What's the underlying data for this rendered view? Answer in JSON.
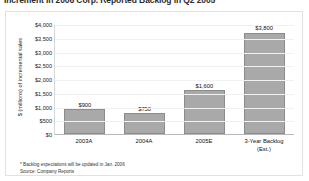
{
  "document": {
    "title": "Increment in 2006 Corp. Reported Backlog in Q2 2005"
  },
  "chart_data": {
    "type": "bar",
    "title": "",
    "categories": [
      "2003A",
      "2004A",
      "2005E",
      "3-Year Backlog (Est.)"
    ],
    "category_lines": [
      [
        "2003A"
      ],
      [
        "2004A"
      ],
      [
        "2005E"
      ],
      [
        "3-Year Backlog",
        "(Est.)"
      ]
    ],
    "values": [
      900,
      750,
      1600,
      3800
    ],
    "value_labels": [
      "$900",
      "$750",
      "$1,600",
      "$3,800"
    ],
    "xlabel": "",
    "ylabel": "$ (millions) of incremental sales",
    "ylim": [
      0,
      4000
    ],
    "ytick_values": [
      4000,
      3500,
      3000,
      2500,
      2000,
      1500,
      1000,
      500,
      0
    ],
    "ytick_labels": [
      "$4,000",
      "$3,500",
      "$3,000",
      "$2,500",
      "$2,000",
      "$1,500",
      "$1,000",
      "$500",
      "$0"
    ],
    "grid": true,
    "legend": false,
    "bar_color": "#a9a9a9",
    "bar_border_color": "#8c8c8c",
    "gridline_color": "#f1f1f1",
    "frame_color": "#e2e2e2"
  },
  "footnotes": {
    "backlog_note": "* Backlog expectations will be updated in Jan. 2006",
    "source": "Source: Company Reports"
  }
}
